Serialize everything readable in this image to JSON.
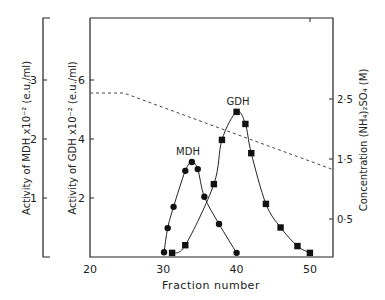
{
  "chart_data": {
    "type": "line",
    "title": "",
    "xlabel": "Fraction number",
    "x_ticks": [
      20,
      30,
      40,
      50
    ],
    "xlim": [
      20,
      53
    ],
    "axes": {
      "mdh_axis": {
        "label": "Activity of MDH x10⁻² (e.u./ml)",
        "ticks": [
          1,
          2,
          3
        ],
        "ylim": [
          0,
          4
        ]
      },
      "gdh_axis": {
        "label": "Activity of GDH x10⁻² (e.u./ml)",
        "ticks": [
          2,
          4,
          6
        ],
        "ylim": [
          0,
          8
        ]
      },
      "conc_axis": {
        "label": "Concentration (NH₄)₂SO₄ (M)",
        "ticks": [
          "0·5",
          "1·5",
          "2·5"
        ],
        "tick_values": [
          0.5,
          1.5,
          2.5
        ],
        "ylim": [
          0,
          4
        ]
      }
    },
    "series": [
      {
        "name": "MDH",
        "marker": "circle",
        "axis": "mdh_axis",
        "x": [
          30.1,
          30.6,
          31.4,
          33.0,
          33.9,
          34.7,
          35.6,
          37.6,
          40.0
        ],
        "values": [
          0.08,
          0.49,
          0.85,
          1.46,
          1.61,
          1.49,
          1.02,
          0.56,
          0.07
        ]
      },
      {
        "name": "GDH",
        "marker": "square",
        "axis": "gdh_axis",
        "x": [
          31.2,
          33.0,
          36.9,
          38.0,
          40.0,
          41.2,
          42.0,
          44.0,
          46.0,
          48.3,
          50.0
        ],
        "values": [
          0.14,
          0.4,
          2.47,
          3.97,
          4.92,
          4.51,
          3.52,
          1.8,
          1.0,
          0.37,
          0.14
        ]
      },
      {
        "name": "(NH4)2SO4 gradient",
        "style": "dashed",
        "axis": "conc_axis",
        "x": [
          20,
          24.6,
          53
        ],
        "values": [
          2.6,
          2.6,
          1.33
        ]
      }
    ],
    "annotations": [
      "MDH",
      "GDH"
    ],
    "grid": false
  }
}
